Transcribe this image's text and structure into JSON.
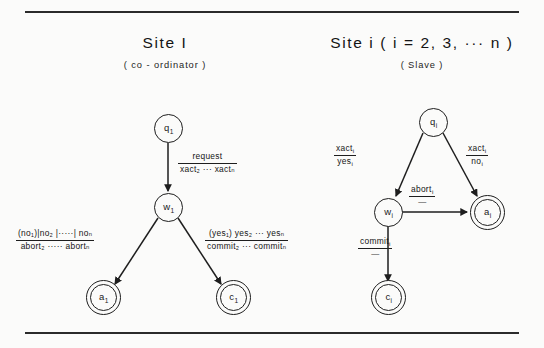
{
  "figure": {
    "panels": [
      {
        "id": "site-1",
        "title": "Site  I",
        "subtitle": "( co - ordinator )",
        "nodes": [
          {
            "name": "q1",
            "label_base": "q",
            "label_sub": "1",
            "type": "state"
          },
          {
            "name": "w1",
            "label_base": "w",
            "label_sub": "1",
            "type": "state"
          },
          {
            "name": "a1",
            "label_base": "a",
            "label_sub": "1",
            "type": "final"
          },
          {
            "name": "c1",
            "label_base": "c",
            "label_sub": "1",
            "type": "final"
          }
        ],
        "edges": [
          {
            "name": "q1-to-w1",
            "from": "q1",
            "to": "w1",
            "numerator": "request",
            "denominator": "xact₂ ··· xactₙ"
          },
          {
            "name": "w1-to-a1",
            "from": "w1",
            "to": "a1",
            "numerator": "(no₁)|no₂ |·····| noₙ",
            "denominator": "abort₂ ····· abortₙ"
          },
          {
            "name": "w1-to-c1",
            "from": "w1",
            "to": "c1",
            "numerator": "(yes₁) yes₂ ··· yesₙ",
            "denominator": "commit₂ ··· commitₙ"
          }
        ]
      },
      {
        "id": "site-i",
        "title": "Site  i   ( i = 2, 3, ··· n )",
        "subtitle": "( Slave )",
        "nodes": [
          {
            "name": "qi",
            "label_base": "q",
            "label_sub": "i",
            "type": "state"
          },
          {
            "name": "wi",
            "label_base": "w",
            "label_sub": "i",
            "type": "state"
          },
          {
            "name": "ai",
            "label_base": "a",
            "label_sub": "i",
            "type": "final"
          },
          {
            "name": "ci",
            "label_base": "c",
            "label_sub": "i",
            "type": "final"
          }
        ],
        "edges": [
          {
            "name": "qi-to-wi",
            "from": "qi",
            "to": "wi",
            "numerator": "xact",
            "numerator_sub": "i",
            "denominator": "yes",
            "denominator_sub": "i"
          },
          {
            "name": "qi-to-ai",
            "from": "qi",
            "to": "ai",
            "numerator": "xact",
            "numerator_sub": "i",
            "denominator": "no",
            "denominator_sub": "i"
          },
          {
            "name": "wi-to-ai",
            "from": "wi",
            "to": "ai",
            "numerator": "abort",
            "numerator_sub": "i",
            "denominator": "—"
          },
          {
            "name": "wi-to-ci",
            "from": "wi",
            "to": "ci",
            "numerator": "commit",
            "numerator_sub": "i",
            "denominator": "—"
          }
        ]
      }
    ],
    "colors": {
      "ink": "#1e1e1e",
      "paper": "#fbfbfa",
      "rule": "#2b2b2b"
    }
  }
}
